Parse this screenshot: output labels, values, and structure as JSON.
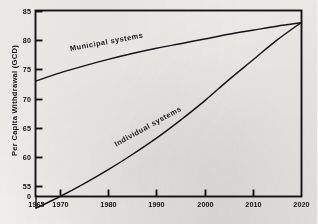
{
  "figure": {
    "background_color": "#f3f1ed",
    "ink_color": "#141317"
  },
  "chart_data": {
    "type": "line",
    "title": "",
    "subtitle": "",
    "xlabel": "",
    "ylabel": "Per Capita Withdrawal (GCD)",
    "grid": false,
    "legend_position": "inline-curve-labels",
    "x_tick_labels": [
      "1965",
      "1970",
      "1980",
      "1990",
      "2000",
      "2010",
      "2020"
    ],
    "x_tick_values": [
      1965,
      1970,
      1980,
      1990,
      2000,
      2010,
      2020
    ],
    "xlim": [
      1965,
      2020
    ],
    "y_tick_labels": [
      "0",
      "55",
      "60",
      "65",
      "70",
      "75",
      "80",
      "85"
    ],
    "y_tick_values": [
      0,
      55,
      60,
      65,
      70,
      75,
      80,
      85
    ],
    "ylim": [
      55,
      85
    ],
    "y_axis_break": true,
    "y_axis_break_note": "axis broken between 0 and 55",
    "series": [
      {
        "name": "Municipal systems",
        "x": [
          1965,
          1970,
          1975,
          1980,
          1985,
          1990,
          1995,
          2000,
          2005,
          2010,
          2015,
          2020
        ],
        "values": [
          73.0,
          74.4,
          75.6,
          76.7,
          77.7,
          78.6,
          79.4,
          80.2,
          81.0,
          81.7,
          82.4,
          83.0
        ]
      },
      {
        "name": "Individual systems",
        "x": [
          1965,
          1970,
          1975,
          1980,
          1985,
          1990,
          1995,
          2000,
          2005,
          2010,
          2015,
          2020
        ],
        "values": [
          51.2,
          53.2,
          55.4,
          57.8,
          60.4,
          63.2,
          66.3,
          69.6,
          73.2,
          76.6,
          80.0,
          83.0
        ]
      }
    ],
    "annotations": [
      {
        "text": "Municipal systems",
        "near_series": "Municipal systems"
      },
      {
        "text": "Individual systems",
        "near_series": "Individual systems"
      }
    ]
  }
}
